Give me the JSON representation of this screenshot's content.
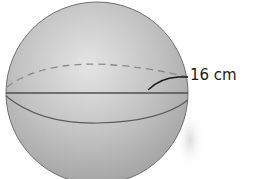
{
  "figure": {
    "shape": "sphere",
    "diameter_label": "16 cm",
    "colors": {
      "sphere_fill": "#b8b8b8",
      "sphere_highlight": "#e6e6e6",
      "outline": "#6e6e6e",
      "equator_line": "#555555",
      "dashed_arc": "#808080",
      "label_text": "#1a1a1a",
      "background": "#ffffff"
    }
  }
}
